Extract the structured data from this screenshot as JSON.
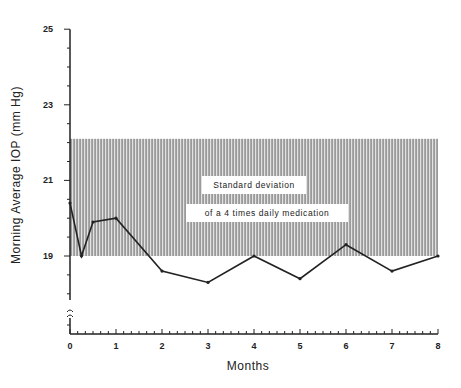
{
  "chart_data": {
    "type": "line",
    "title": "",
    "xlabel": "Months",
    "ylabel": "Morning Average IOP (mm Hg)",
    "x": [
      0,
      0.25,
      0.5,
      1,
      2,
      3,
      4,
      5,
      6,
      7,
      8
    ],
    "series": [
      {
        "name": "Morning average IOP",
        "values": [
          20.4,
          19.0,
          19.9,
          20.0,
          18.6,
          18.3,
          19.0,
          18.4,
          19.3,
          18.6,
          19.0
        ]
      }
    ],
    "band": {
      "label_line1": "Standard deviation",
      "label_line2": "of a 4 times daily medication",
      "y_low": 19.0,
      "y_high": 22.1,
      "x_start": 0,
      "x_end": 8
    },
    "x_ticks": [
      "0",
      "1",
      "2",
      "3",
      "4",
      "5",
      "6",
      "7",
      "8"
    ],
    "y_ticks": [
      "19",
      "21",
      "23",
      "25"
    ],
    "xlim": [
      0,
      8
    ],
    "ylim": [
      0,
      25
    ],
    "y_axis_break": true,
    "grid": false,
    "legend": "none"
  },
  "labels": {
    "xlabel": "Months",
    "ylabel": "Morning Average IOP (mm Hg)",
    "band_line1": "Standard deviation",
    "band_line2": "of a 4 times daily medication",
    "x_ticks": [
      "0",
      "1",
      "2",
      "3",
      "4",
      "5",
      "6",
      "7",
      "8"
    ],
    "y_ticks": [
      "19",
      "21",
      "23",
      "25"
    ]
  },
  "colors": {
    "ink": "#222222",
    "band_fill": "#8a8a8a",
    "band_stripe_light": "#d8d8d8",
    "background": "#ffffff"
  }
}
